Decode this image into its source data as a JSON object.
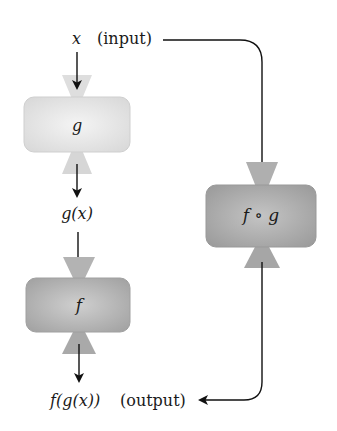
{
  "diagram": {
    "input_var": "x",
    "input_label": "(input)",
    "intermediate_label": "g(x)",
    "output_expr": "f(g(x))",
    "output_label": "(output)",
    "boxes": [
      {
        "id": "g",
        "label": "g",
        "fill": "#e6e6e6"
      },
      {
        "id": "f",
        "label": "f",
        "fill": "#b8b8b8"
      },
      {
        "id": "fog",
        "label": "f ∘ g",
        "fill": "#ababab"
      }
    ],
    "colors": {
      "arrow": "#111111",
      "box_light": "#e6e6e6",
      "box_dark": "#b5b5b5",
      "funnel_light": "#dcdcdc",
      "funnel_dark": "#a8a8a8"
    }
  }
}
